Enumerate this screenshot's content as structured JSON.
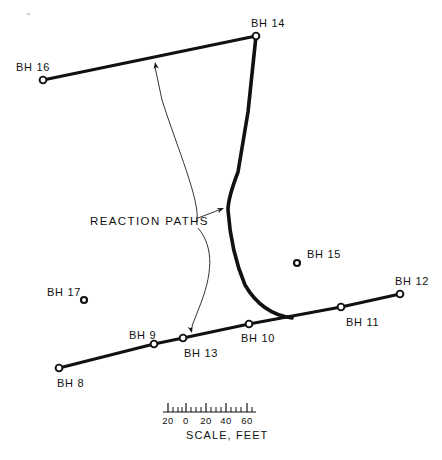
{
  "figure": {
    "background_color": "#ffffff",
    "ink_color": "#111111",
    "width": 442,
    "height": 460
  },
  "annotation": {
    "reaction_paths_label": "REACTION PATHS"
  },
  "boreholes": [
    {
      "id": "BH16",
      "label": "BH 16",
      "node_x": 43,
      "node_y": 80,
      "label_x": 16,
      "label_y": 62,
      "on_line": true
    },
    {
      "id": "BH14",
      "label": "BH 14",
      "node_x": 256,
      "node_y": 36,
      "label_x": 251,
      "label_y": 18,
      "on_line": true
    },
    {
      "id": "BH15",
      "label": "BH 15",
      "node_x": 297,
      "node_y": 263,
      "label_x": 307,
      "label_y": 249,
      "on_line": false
    },
    {
      "id": "BH12",
      "label": "BH 12",
      "node_x": 400,
      "node_y": 294,
      "label_x": 395,
      "label_y": 276,
      "on_line": true
    },
    {
      "id": "BH11",
      "label": "BH 11",
      "node_x": 341,
      "node_y": 307,
      "label_x": 346,
      "label_y": 317,
      "on_line": true
    },
    {
      "id": "BH10",
      "label": "BH 10",
      "node_x": 249,
      "node_y": 324,
      "label_x": 241,
      "label_y": 333,
      "on_line": true
    },
    {
      "id": "BH13",
      "label": "BH 13",
      "node_x": 183,
      "node_y": 338,
      "label_x": 184,
      "label_y": 348,
      "on_line": true
    },
    {
      "id": "BH9",
      "label": "BH 9",
      "node_x": 154,
      "node_y": 344,
      "label_x": 129,
      "label_y": 330,
      "on_line": true
    },
    {
      "id": "BH8",
      "label": "BH 8",
      "node_x": 59,
      "node_y": 368,
      "label_x": 57,
      "label_y": 378,
      "on_line": true
    },
    {
      "id": "BH17",
      "label": "BH 17",
      "node_x": 84,
      "node_y": 300,
      "label_x": 47,
      "label_y": 287,
      "on_line": false
    }
  ],
  "scale": {
    "caption": "SCALE, FEET",
    "major_labels": [
      "20",
      "0",
      "20",
      "40",
      "60"
    ],
    "major_tick_x": [
      168,
      186,
      206,
      226,
      247
    ],
    "minor_tick_x": [
      173,
      178,
      182,
      191,
      196,
      201,
      211,
      216,
      221,
      231,
      236,
      241,
      252
    ],
    "baseline_y": 412,
    "baseline_x_start": 163,
    "baseline_x_end": 256,
    "caption_x": 186,
    "caption_y": 430
  },
  "survey_lines": [
    {
      "name": "bh16-bh14-line",
      "points": "43,80 256,36"
    },
    {
      "name": "bh8-bh12-line",
      "points": "59,368 154,344 183,338 249,324 341,307 400,294"
    }
  ],
  "reaction_path_curve": {
    "name": "reaction-path-curve",
    "description": "Thick curve from BH14 south, bending east to join the BH8-BH12 line",
    "path": "M 256,36 L 248,112 L 238,172 Q 228,198 228,210 Q 231,252 245,285 Q 262,314 292,318"
  },
  "leader_lines": [
    {
      "name": "leader-to-upper-line",
      "path": "M 197,222 C 200,200 178,150 162,100 L 155,67",
      "arrow_x": 155,
      "arrow_y": 62,
      "arrow_angle": -100
    },
    {
      "name": "leader-to-curve-bend",
      "path": "M 198,218 L 219,210",
      "arrow_x": 224,
      "arrow_y": 208,
      "arrow_angle": -22
    },
    {
      "name": "leader-to-lower-line",
      "path": "M 198,228 C 215,248 212,276 199,308 L 192,326",
      "arrow_x": 192,
      "arrow_y": 333,
      "arrow_angle": 75
    }
  ]
}
